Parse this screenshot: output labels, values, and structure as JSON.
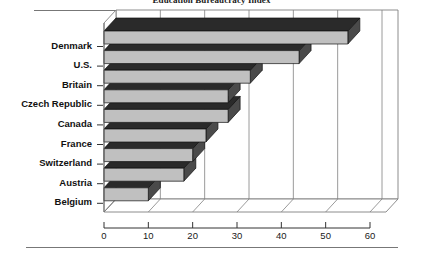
{
  "chart_data": {
    "type": "bar",
    "orientation": "horizontal",
    "style": "3d-bar",
    "title": "Education Bureaucracy Index",
    "xlabel": "",
    "ylabel": "",
    "xlim": [
      0,
      60
    ],
    "xticks": [
      0,
      10,
      20,
      30,
      40,
      50,
      60
    ],
    "grid": true,
    "legend": false,
    "categories": [
      "Denmark",
      "U.S.",
      "Britain",
      "Czech Republic",
      "Canada",
      "France",
      "Switzerland",
      "Austria",
      "Belgium"
    ],
    "values": [
      55,
      44,
      33,
      28,
      28,
      23,
      20,
      18,
      10
    ],
    "colors": {
      "bar_face": "#c0c0c0",
      "bar_top": "#2a2a2a",
      "bar_side": "#4a4a4a",
      "plot_background": "#ffffff",
      "frame": "#808080",
      "text": "#111111"
    }
  },
  "axis": {
    "tick_labels": [
      "0",
      "10",
      "20",
      "30",
      "40",
      "50",
      "60"
    ]
  }
}
